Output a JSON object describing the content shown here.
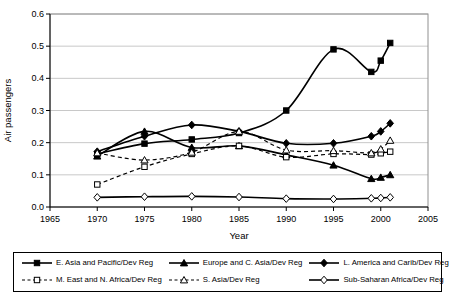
{
  "chart_data": {
    "type": "line",
    "title": "",
    "xlabel": "Year",
    "ylabel": "Air passengers",
    "xlim": [
      1965,
      2005
    ],
    "ylim": [
      0.0,
      0.6
    ],
    "x_ticks": [
      1965,
      1970,
      1975,
      1980,
      1985,
      1990,
      1995,
      2000,
      2005
    ],
    "y_ticks": [
      0.0,
      0.1,
      0.2,
      0.3,
      0.4,
      0.5,
      0.6
    ],
    "grid": "horizontal",
    "legend_position": "bottom",
    "x": [
      1970,
      1975,
      1980,
      1985,
      1990,
      1995,
      1999,
      2000,
      2001
    ],
    "series": [
      {
        "name": "E. Asia and Pacific/Dev Reg",
        "marker": "square-filled",
        "line_style": "solid",
        "values": [
          0.165,
          0.197,
          0.21,
          0.23,
          0.3,
          0.49,
          0.42,
          0.455,
          0.51
        ]
      },
      {
        "name": "Europe and C. Asia/Dev Reg",
        "marker": "triangle-filled",
        "line_style": "solid",
        "values": [
          0.158,
          0.235,
          0.185,
          0.19,
          0.162,
          0.13,
          0.088,
          0.092,
          0.1
        ]
      },
      {
        "name": "L. America and Carib/Dev Reg",
        "marker": "diamond-filled",
        "line_style": "solid",
        "values": [
          0.172,
          0.22,
          0.255,
          0.235,
          0.198,
          0.198,
          0.22,
          0.235,
          0.26
        ]
      },
      {
        "name": "M. East and N. Africa/Dev Reg",
        "marker": "square-open",
        "line_style": "dashed",
        "values": [
          0.07,
          0.125,
          0.165,
          0.19,
          0.155,
          0.165,
          0.163,
          0.167,
          0.172
        ]
      },
      {
        "name": "S. Asia/Dev Reg",
        "marker": "triangle-open",
        "line_style": "dashed",
        "values": [
          0.168,
          0.146,
          0.17,
          0.235,
          0.177,
          0.175,
          0.168,
          0.18,
          0.207
        ]
      },
      {
        "name": "Sub-Saharan Africa/Dev Reg",
        "marker": "diamond-open",
        "line_style": "solid",
        "values": [
          0.03,
          0.032,
          0.033,
          0.031,
          0.026,
          0.025,
          0.027,
          0.028,
          0.03
        ]
      }
    ],
    "colors": {
      "line": "#000000",
      "grid": "#c8c8c8",
      "border": "#909090",
      "background": "#ffffff"
    }
  }
}
